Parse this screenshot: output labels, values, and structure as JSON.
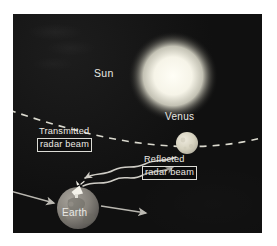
{
  "figure": {
    "type": "astronomy-diagram",
    "background_color": "#121212",
    "frame_color": "#ffffff"
  },
  "bodies": [
    {
      "id": "sun",
      "label": "Sun",
      "kind": "star",
      "color": "#f2f0e6",
      "glow_color": "#fffdf2",
      "cx": 160,
      "cy": 62,
      "r": 35,
      "label_x": 81,
      "label_y": 53
    },
    {
      "id": "venus",
      "label": "Venus",
      "kind": "planet",
      "color": "#d8d5c4",
      "cx": 174,
      "cy": 129,
      "r": 11,
      "label_x": 152,
      "label_y": 97
    },
    {
      "id": "earth",
      "label": "Earth",
      "kind": "planet",
      "color": "#8a8780",
      "cx": 65,
      "cy": 194,
      "r": 21,
      "label_x": 49,
      "label_y": 193
    }
  ],
  "orbit": {
    "name": "venus-orbit",
    "style": "dashed",
    "color": "#eceade",
    "dash": "7 6"
  },
  "beams": [
    {
      "id": "transmitted",
      "caption_line1": "Transmitted",
      "caption_line2": "radar beam",
      "direction": "earth-to-venus",
      "style": "wavy-arrow",
      "color": "#cfcdc6"
    },
    {
      "id": "reflected",
      "caption_line1": "Reflected",
      "caption_line2": "radar beam",
      "direction": "venus-to-earth",
      "style": "wavy-arrow",
      "color": "#cfcdc6"
    }
  ],
  "motion_arrows": [
    {
      "id": "incoming-arrow",
      "color": "#b9b7b0",
      "direction": "right"
    },
    {
      "id": "outgoing-arrow",
      "color": "#b9b7b0",
      "direction": "right"
    }
  ],
  "antenna": {
    "id": "radar-dish",
    "color": "#f4f2ea",
    "description": "radar dish on Earth"
  }
}
